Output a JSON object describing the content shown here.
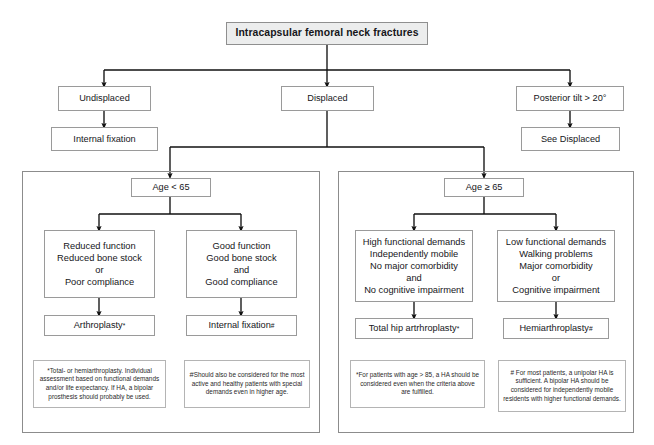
{
  "title": "Intracapsular femoral neck fractures",
  "level1": {
    "undisplaced": "Undisplaced",
    "displaced": "Displaced",
    "posterior_tilt": "Posterior tilt > 20°"
  },
  "level2": {
    "internal_fixation": "Internal fixation",
    "see_displaced": "See Displaced"
  },
  "left_panel": {
    "age_gate": "Age < 65",
    "criteria_left": [
      "Reduced function",
      "Reduced bone stock",
      "or",
      "Poor compliance"
    ],
    "criteria_right": [
      "Good function",
      "Good bone stock",
      "and",
      "Good compliance"
    ],
    "treatment_left": "Arthroplasty",
    "treatment_left_mark": "*",
    "treatment_right": "Internal fixation",
    "treatment_right_mark": "#",
    "note_left": "*Total- or hemiarthroplasty. Individual assessment based on functional demands and/or life expectancy. If HA, a bipolar prosthesis should probably be used.",
    "note_right_mark": "#",
    "note_right": "Should also be considered for the most active and healthy patients with special demands even in higher age."
  },
  "right_panel": {
    "age_gate": "Age ≥ 65",
    "criteria_left": [
      "High functional demands",
      "Independently mobile",
      "No major comorbidity",
      "and",
      "No cognitive impairment"
    ],
    "criteria_right": [
      "Low functional demands",
      "Walking problems",
      "Major comorbidity",
      "or",
      "Cognitive impairment"
    ],
    "treatment_left": "Total hip artrhroplasty",
    "treatment_left_mark": "*",
    "treatment_right": "Hemiarthroplasty",
    "treatment_right_mark": "#",
    "note_left": "*For patients with age > 85, a HA should be considered even when the criteria above are fulfilled.",
    "note_right": "# For most patients, a unipolar HA is sufficient. A bipolar HA should be considered for  independently mobile residents with higher functional demands."
  },
  "colors": {
    "border": "#9a9a9a",
    "panel_border": "#8c8c8c",
    "title_fill": "#eceded",
    "line": "#111111",
    "text": "#16161a"
  }
}
